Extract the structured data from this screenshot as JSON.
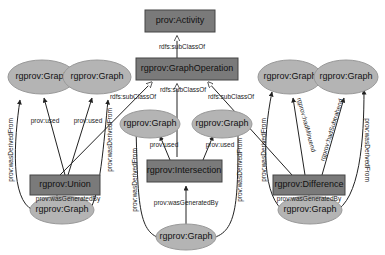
{
  "nodes": {
    "activity": "prov:Activity",
    "graph_operation": "rgprov:GraphOperation",
    "union": "rgprov:Union",
    "intersection": "rgprov:Intersection",
    "difference": "rgprov:Difference",
    "union_in1": "rgprov:Graph",
    "union_in2": "rgprov:Graph",
    "union_out": "rgprov:Graph",
    "inter_in1": "rgprov:Graph",
    "inter_in2": "rgprov:Graph",
    "inter_out": "rgprov:Graph",
    "diff_in1": "rgprov:Graph",
    "diff_in2": "rgprov:Graph",
    "diff_out": "rgprov:Graph"
  },
  "edges": {
    "subclass": "rdfs:subClassOf",
    "used": "prov:used",
    "generated_by": "prov:wasGeneratedBy",
    "derived_from": "prov:wasDerivedFrom",
    "minuend": "rgprov:hadMinuend",
    "subtrahend": "rgprov:hadSubtrahend"
  },
  "colors": {
    "box_fill": "#7a7a7a",
    "ellipse_fill": "#b4b4b4",
    "edge": "#222222"
  }
}
